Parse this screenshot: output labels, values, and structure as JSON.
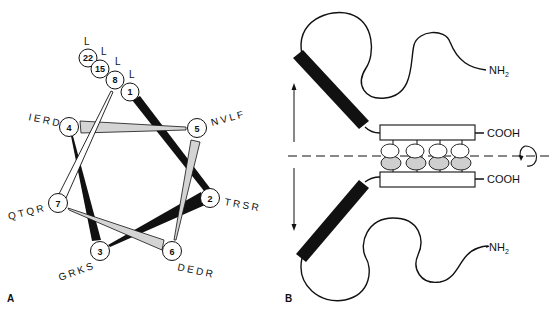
{
  "figure": {
    "panels": [
      {
        "id": "A",
        "label": "A",
        "type": "helical-wheel",
        "stacked_residues": [
          {
            "position": "22",
            "residue": "L"
          },
          {
            "position": "15",
            "residue": "L"
          },
          {
            "position": "8",
            "residue": "L"
          },
          {
            "position": "1",
            "residue": "L"
          }
        ],
        "positions": [
          {
            "position": "1",
            "residues": ""
          },
          {
            "position": "2",
            "residues": "TRSR"
          },
          {
            "position": "3",
            "residues": "GRKS"
          },
          {
            "position": "4",
            "residues": "IERD"
          },
          {
            "position": "5",
            "residues": "NVLF"
          },
          {
            "position": "6",
            "residues": "DEDR"
          },
          {
            "position": "7",
            "residues": "QTQR"
          }
        ],
        "connection_order": [
          "1",
          "2",
          "3",
          "4",
          "5",
          "6",
          "7",
          "8"
        ]
      },
      {
        "id": "B",
        "label": "B",
        "type": "coiled-coil-dimer",
        "top_chain": {
          "n_terminus": "NH2",
          "c_terminus": "COOH"
        },
        "bottom_chain": {
          "n_terminus": "NH2",
          "c_terminus": "COOH"
        },
        "interface_pairs": 4,
        "axis": "dashed-horizontal",
        "rotation_indicator": "curved-arrow",
        "movement_arrows": [
          "up",
          "down"
        ]
      }
    ]
  },
  "colors": {
    "ink": "#111111",
    "fill_gray": "#d4d4d4",
    "background": "#ffffff"
  }
}
